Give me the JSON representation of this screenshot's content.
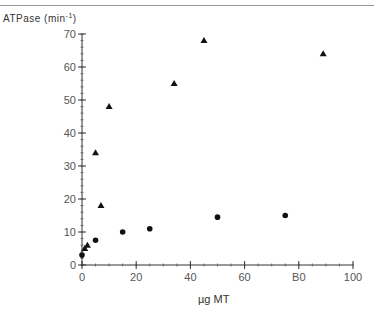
{
  "chart_data": {
    "type": "scatter",
    "title": "",
    "xlabel": "µg MT",
    "ylabel": "ATPase (min-1)",
    "ylabel_main": "ATPase (min",
    "ylabel_sup": "-1",
    "ylabel_close": ")",
    "xlim": [
      0,
      100
    ],
    "ylim": [
      0,
      70
    ],
    "x_ticks": [
      0,
      20,
      40,
      60,
      80,
      100
    ],
    "x_tick_labels": [
      "0",
      "20",
      "40",
      "60",
      "B0",
      "100"
    ],
    "y_ticks": [
      0,
      10,
      20,
      30,
      40,
      50,
      60,
      70
    ],
    "y_tick_labels": [
      "0",
      "10",
      "20",
      "30",
      "40",
      "50",
      "60",
      "70"
    ],
    "grid": false,
    "legend": null,
    "series": [
      {
        "name": "triangles",
        "marker": "triangle",
        "points": [
          [
            1,
            5
          ],
          [
            2,
            6
          ],
          [
            5,
            34
          ],
          [
            7,
            18
          ],
          [
            10,
            48
          ],
          [
            34,
            55
          ],
          [
            45,
            68
          ],
          [
            89,
            64
          ]
        ]
      },
      {
        "name": "circles",
        "marker": "circle",
        "points": [
          [
            0,
            3
          ],
          [
            5,
            7.5
          ],
          [
            15,
            10
          ],
          [
            25,
            11
          ],
          [
            50,
            14.5
          ],
          [
            75,
            15
          ]
        ]
      }
    ]
  }
}
